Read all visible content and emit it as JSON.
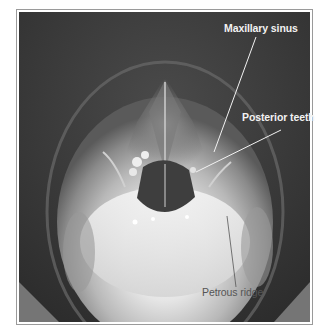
{
  "figure": {
    "type": "radiograph",
    "view": "submentovertex skull",
    "annotations": [
      {
        "id": "maxillary-sinus",
        "label": "Maxillary sinus",
        "text_pos": [
          225,
          24
        ],
        "line": [
          [
            256,
            37
          ],
          [
            214,
            152
          ]
        ],
        "color": "#f2f2f2"
      },
      {
        "id": "posterior-teeth",
        "label": "Posterior teeth",
        "text_pos": [
          242,
          112
        ],
        "line": [
          [
            281,
            130
          ],
          [
            196,
            172
          ]
        ],
        "color": "#f2f2f2"
      },
      {
        "id": "petrous-ridge",
        "label": "Petrous ridge",
        "text_pos": [
          202,
          287
        ],
        "line": [
          [
            227,
            216
          ],
          [
            236,
            287
          ]
        ],
        "color": "#555555"
      }
    ]
  }
}
